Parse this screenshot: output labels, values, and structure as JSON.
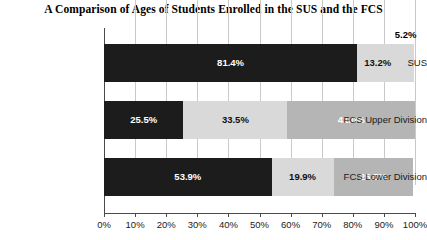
{
  "chart_data": {
    "type": "bar",
    "orientation": "horizontal",
    "stacked": true,
    "stacked_mode": "percent",
    "title": "A Comparison of Ages of Students Enrolled in the SUS and the FCS",
    "xlabel": "",
    "ylabel": "",
    "xlim": [
      0,
      100
    ],
    "xticks": [
      0,
      10,
      20,
      30,
      40,
      50,
      60,
      70,
      80,
      90,
      100
    ],
    "xtick_labels": [
      "0%",
      "10%",
      "20%",
      "30%",
      "40%",
      "50%",
      "60%",
      "70%",
      "80%",
      "90%",
      "100%"
    ],
    "grid": true,
    "grid_axis": "x",
    "legend": false,
    "categories": [
      "SUS",
      "FCS Upper Division",
      "FCS Lower Division"
    ],
    "series": [
      {
        "name": "segment-1",
        "color": "#1c1c1c",
        "label_color": "#ffffff",
        "values": [
          81.4,
          25.5,
          53.9
        ],
        "value_labels": [
          "81.4%",
          "25.5%",
          "53.9%"
        ]
      },
      {
        "name": "segment-2",
        "color": "#d9d9d9",
        "label_color": "#111111",
        "values": [
          13.2,
          33.5,
          19.9
        ],
        "value_labels": [
          "13.2%",
          "33.5%",
          "19.9%"
        ]
      },
      {
        "name": "segment-3",
        "color": "#b5b5b5",
        "label_color": "#ffffff",
        "values": [
          5.2,
          41.0,
          25.5
        ],
        "value_labels": [
          "5.2%",
          "41.0%",
          "25.5%"
        ]
      }
    ],
    "rows": [
      {
        "category": "SUS",
        "segments": [
          {
            "value": 81.4,
            "label": "81.4%",
            "color": "#1c1c1c",
            "label_color": "#ffffff",
            "label_position": "inside"
          },
          {
            "value": 13.2,
            "label": "13.2%",
            "color": "#d9d9d9",
            "label_color": "#111111",
            "label_position": "inside"
          },
          {
            "value": 5.2,
            "label": "5.2%",
            "color": "#d9d9d9",
            "label_color": "#000000",
            "label_position": "outside-above"
          }
        ]
      },
      {
        "category": "FCS Upper Division",
        "segments": [
          {
            "value": 25.5,
            "label": "25.5%",
            "color": "#1c1c1c",
            "label_color": "#ffffff",
            "label_position": "inside"
          },
          {
            "value": 33.5,
            "label": "33.5%",
            "color": "#d9d9d9",
            "label_color": "#111111",
            "label_position": "inside"
          },
          {
            "value": 41.0,
            "label": "41.0%",
            "color": "#b5b5b5",
            "label_color": "#ffffff",
            "label_position": "inside"
          }
        ]
      },
      {
        "category": "FCS Lower Division",
        "segments": [
          {
            "value": 53.9,
            "label": "53.9%",
            "color": "#1c1c1c",
            "label_color": "#ffffff",
            "label_position": "inside"
          },
          {
            "value": 19.9,
            "label": "19.9%",
            "color": "#d9d9d9",
            "label_color": "#111111",
            "label_position": "inside"
          },
          {
            "value": 25.5,
            "label": "25.5%",
            "color": "#b5b5b5",
            "label_color": "#ffffff",
            "label_position": "inside"
          }
        ]
      }
    ]
  },
  "style": {
    "background": "#ffffff",
    "axis_color": "#4a4a4a",
    "grid_color": "#c9c9c9",
    "title_color": "#000000",
    "label_color": "#1a1a1a"
  }
}
